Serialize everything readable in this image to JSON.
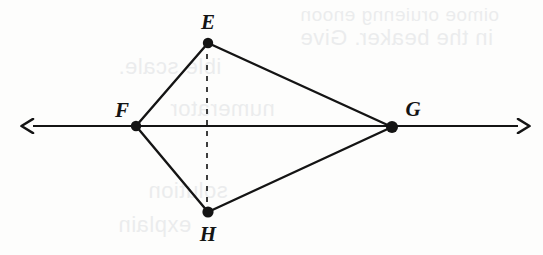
{
  "figure": {
    "canvas": {
      "width": 543,
      "height": 255
    },
    "background_color": "#fdfdfc",
    "ink_color": "#141414",
    "points": [
      {
        "id": "E",
        "label": "E",
        "x": 208,
        "y": 43,
        "label_x": 208,
        "label_y": 22
      },
      {
        "id": "F",
        "label": "F",
        "x": 136,
        "y": 126,
        "label_x": 122,
        "label_y": 110
      },
      {
        "id": "G",
        "label": "G",
        "x": 392,
        "y": 127,
        "label_x": 413,
        "label_y": 109
      },
      {
        "id": "H",
        "label": "H",
        "x": 208,
        "y": 212,
        "label_x": 208,
        "label_y": 234
      }
    ],
    "segments": [
      {
        "name": "segment-FE",
        "from": "F",
        "to": "E",
        "style": "solid"
      },
      {
        "name": "segment-EG",
        "from": "E",
        "to": "G",
        "style": "solid"
      },
      {
        "name": "segment-FH",
        "from": "F",
        "to": "H",
        "style": "solid"
      },
      {
        "name": "segment-HG",
        "from": "H",
        "to": "G",
        "style": "solid"
      }
    ],
    "dashed_segment": {
      "name": "segment-EH-dashed",
      "from": "E",
      "to": "H",
      "x": 207,
      "y1": 43,
      "y2": 212,
      "dash": "5 6"
    },
    "line": {
      "name": "line-FG",
      "y": 126,
      "x_start": 33,
      "x_end": 518,
      "arrow_left": true,
      "arrow_right": true
    }
  },
  "ghost_text": {
    "note": "faint bleed-through from reverse side of page",
    "lines": [
      {
        "text": "oimoe oruienng enoon",
        "x": 300,
        "y": 4,
        "size": 19
      },
      {
        "text": "in the beaker. Give",
        "x": 300,
        "y": 25,
        "size": 22
      },
      {
        "text": "ible scale.",
        "x": 118,
        "y": 54,
        "size": 22
      },
      {
        "text": "numerator",
        "x": 170,
        "y": 96,
        "size": 22
      },
      {
        "text": "solution",
        "x": 148,
        "y": 178,
        "size": 22
      },
      {
        "text": "explain",
        "x": 118,
        "y": 212,
        "size": 22
      }
    ]
  }
}
